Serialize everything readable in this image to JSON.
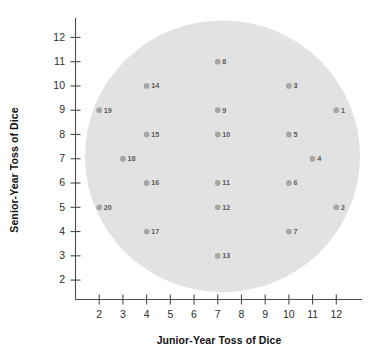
{
  "chart_data": {
    "type": "scatter",
    "title": "",
    "xlabel": "Junior-Year Toss of Dice",
    "ylabel": "Senior-Year Toss of Dice",
    "xlim": [
      1,
      13
    ],
    "ylim": [
      1.2,
      12.8
    ],
    "xticks": [
      2,
      3,
      4,
      5,
      6,
      7,
      8,
      9,
      10,
      11,
      12
    ],
    "yticks": [
      2,
      3,
      4,
      5,
      6,
      7,
      8,
      9,
      10,
      11,
      12
    ],
    "grid": false,
    "legend": null,
    "marker_color": "#a6a6a6",
    "region_color": "#e2e2e2",
    "annotations": [
      {
        "label": "1",
        "x": 12,
        "y": 9
      },
      {
        "label": "2",
        "x": 12,
        "y": 5
      },
      {
        "label": "3",
        "x": 10,
        "y": 10
      },
      {
        "label": "4",
        "x": 11,
        "y": 7
      },
      {
        "label": "5",
        "x": 10,
        "y": 8
      },
      {
        "label": "6",
        "x": 10,
        "y": 6
      },
      {
        "label": "7",
        "x": 10,
        "y": 4
      },
      {
        "label": "8",
        "x": 7,
        "y": 11
      },
      {
        "label": "9",
        "x": 7,
        "y": 9
      },
      {
        "label": "10",
        "x": 7,
        "y": 8
      },
      {
        "label": "11",
        "x": 7,
        "y": 6
      },
      {
        "label": "12",
        "x": 7,
        "y": 5
      },
      {
        "label": "13",
        "x": 7,
        "y": 3
      },
      {
        "label": "14",
        "x": 4,
        "y": 10
      },
      {
        "label": "15",
        "x": 4,
        "y": 8
      },
      {
        "label": "16",
        "x": 4,
        "y": 6
      },
      {
        "label": "17",
        "x": 4,
        "y": 4
      },
      {
        "label": "18",
        "x": 3,
        "y": 7
      },
      {
        "label": "19",
        "x": 2,
        "y": 9
      },
      {
        "label": "20",
        "x": 2,
        "y": 5
      }
    ],
    "points": {
      "x": [
        12,
        12,
        10,
        11,
        10,
        10,
        10,
        7,
        7,
        7,
        7,
        7,
        7,
        4,
        4,
        4,
        4,
        3,
        2,
        2
      ],
      "y": [
        9,
        5,
        10,
        7,
        8,
        6,
        4,
        11,
        9,
        8,
        6,
        5,
        3,
        10,
        8,
        6,
        4,
        7,
        9,
        5
      ],
      "labels": [
        "1",
        "2",
        "3",
        "4",
        "5",
        "6",
        "7",
        "8",
        "9",
        "10",
        "11",
        "12",
        "13",
        "14",
        "15",
        "16",
        "17",
        "18",
        "19",
        "20"
      ]
    },
    "shaded_ellipse": {
      "center_x": 7.2,
      "center_y": 7.1,
      "radius_x": 5.8,
      "radius_y": 5.6
    }
  }
}
